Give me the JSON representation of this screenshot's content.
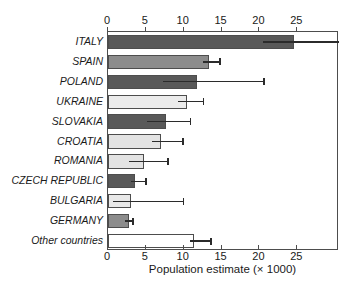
{
  "chart_data": {
    "type": "bar",
    "orientation": "horizontal",
    "title": "",
    "subtitle": "",
    "xlabel": "Population estimate (× 1000)",
    "ylabel": "",
    "xlim": [
      0,
      30.5
    ],
    "xticks": [
      0,
      5,
      10,
      15,
      20,
      25
    ],
    "xtick_labels": [
      "0",
      "5",
      "10",
      "15",
      "20",
      "25"
    ],
    "axis_top": true,
    "axis_bottom": true,
    "grid": false,
    "legend": null,
    "categories": [
      "ITALY",
      "SPAIN",
      "POLAND",
      "UKRAINE",
      "SLOVAKIA",
      "CROATIA",
      "ROMANIA",
      "CZECH REPUBLIC",
      "BULGARIA",
      "GERMANY",
      "Other countries"
    ],
    "values": [
      24.6,
      13.4,
      11.8,
      10.4,
      7.7,
      7.0,
      4.8,
      3.5,
      3.0,
      2.8,
      11.3
    ],
    "error_low": [
      20.4,
      12.6,
      7.2,
      9.2,
      5.1,
      5.8,
      2.8,
      3.0,
      0.7,
      2.2,
      10.8
    ],
    "error_high": [
      30.5,
      14.8,
      20.6,
      12.6,
      10.9,
      9.9,
      7.9,
      5.0,
      10.0,
      3.3,
      13.6
    ],
    "bar_colors": [
      "#595959",
      "#8c8c8c",
      "#595959",
      "#ebebeb",
      "#595959",
      "#e3e3e3",
      "#e3e3e3",
      "#595959",
      "#e8e8e8",
      "#8c8c8c",
      "#ffffff"
    ],
    "bar_edge_color": "#4d4d4d",
    "error_color": "#2b2b2b",
    "axis_color": "#4d4d4d",
    "background": "#ffffff"
  }
}
